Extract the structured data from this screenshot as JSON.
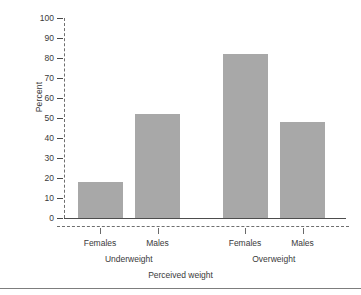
{
  "chart_data": {
    "type": "bar",
    "title": "",
    "subtitle": "",
    "xlabel": "Perceived weight",
    "ylabel": "Percent",
    "categories": [
      "Females",
      "Males",
      "Females",
      "Males"
    ],
    "groups": [
      {
        "label": "Underweight",
        "categories": [
          "Females",
          "Males"
        ],
        "values": [
          18,
          52
        ]
      },
      {
        "label": "Overweight",
        "categories": [
          "Females",
          "Males"
        ],
        "values": [
          82,
          48
        ]
      }
    ],
    "values": [
      18,
      52,
      82,
      48
    ],
    "ylim": [
      0,
      100
    ],
    "yticks": [
      0,
      10,
      20,
      30,
      40,
      50,
      60,
      70,
      80,
      90,
      100
    ],
    "ytick_labels": [
      "0",
      "10",
      "20",
      "30",
      "40",
      "50",
      "60",
      "70",
      "80",
      "90",
      "100"
    ],
    "grid": false,
    "legend": false,
    "bar_color": "#a8a8a8",
    "axis_color": "#6f6f6f",
    "baseline_color": "#4d4d4d",
    "axis_style": "dashed"
  },
  "axes": {
    "y_title": "Percent",
    "x_title": "Perceived weight"
  }
}
